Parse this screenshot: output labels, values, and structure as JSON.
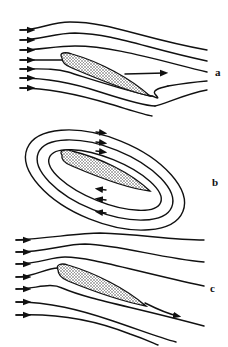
{
  "figure": {
    "panels": [
      {
        "label": "a",
        "description": "Uniform flow past inclined airfoil with rear stagnation point on upper surface (flow curls around sharp trailing edge), no circulation"
      },
      {
        "label": "b",
        "description": "Pure circulation flow around airfoil (closed streamlines)"
      },
      {
        "label": "c",
        "description": "Combined flow satisfying Kutta condition: smooth flow leaving trailing edge"
      }
    ]
  }
}
